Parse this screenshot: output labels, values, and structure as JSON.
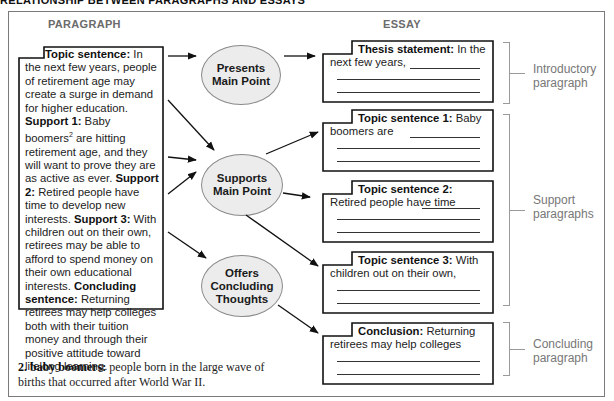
{
  "title": "RELATIONSHIP BETWEEN PARAGRAPHS AND ESSAYS",
  "columns": {
    "paragraph": "PARAGRAPH",
    "essay": "ESSAY"
  },
  "paragraph_box": {
    "topic_label": "Topic sentence:",
    "topic_text": " In the next few years, people of retirement age may create a surge in demand for higher education. ",
    "support1_label": "Support 1:",
    "support1_text_a": " Baby boomers",
    "support1_sup": "2",
    "support1_text_b": " are hitting retirement age, and they will want to prove they are as active as ever. ",
    "support2_label": "Support 2:",
    "support2_text": " Retired people have time to develop new interests. ",
    "support3_label": "Support 3:",
    "support3_text": " With children out on their own, retirees may be able to afford to spend money on their own educational interests. ",
    "concluding_label": "Concluding sentence:",
    "concluding_text": " Returning retirees may help colleges both with their tuition money and through their positive attitude toward lifelong learning."
  },
  "ellipses": {
    "presents": [
      "Presents",
      "Main Point"
    ],
    "supports": [
      "Supports",
      "Main Point"
    ],
    "offers": [
      "Offers",
      "Concluding",
      "Thoughts"
    ]
  },
  "essay_boxes": {
    "thesis": {
      "label": "Thesis statement:",
      "text": " In the next few years,"
    },
    "topic1": {
      "label": "Topic sentence 1:",
      "text": " Baby boomers are"
    },
    "topic2": {
      "label": "Topic sentence 2:",
      "text": " Retired people have time"
    },
    "topic3": {
      "label": "Topic sentence 3:",
      "text": " With children out on their own,"
    },
    "conclusion": {
      "label": "Conclusion:",
      "text": " Returning retirees may help colleges"
    }
  },
  "side_labels": {
    "intro": [
      "Introductory",
      "paragraph"
    ],
    "support": [
      "Support",
      "paragraphs"
    ],
    "concluding": [
      "Concluding",
      "paragraph"
    ]
  },
  "footnote": {
    "term": "2. baby boomers:",
    "definition_line1": " people born in the large wave of",
    "definition_line2": "births that occurred after World War II."
  },
  "colors": {
    "ellipse_fill": "#ececec",
    "header_gray": "#6b6b6b",
    "side_label_gray": "#777777"
  }
}
